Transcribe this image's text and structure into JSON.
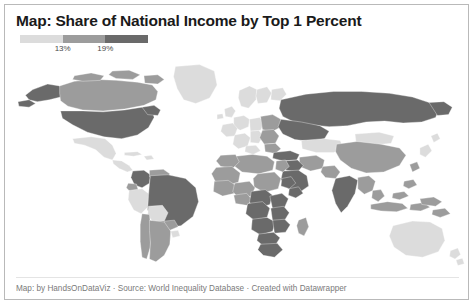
{
  "chart_data": {
    "type": "map",
    "title": "Map: Share of National Income by Top 1 Percent",
    "subtitle": "",
    "map_projection": "world-equirectangular",
    "legend": {
      "position": "top-left",
      "orientation": "horizontal",
      "breaks": [
        "13%",
        "19%"
      ],
      "tick_values": [
        13,
        19
      ],
      "unit": "%",
      "classes": [
        {
          "label": "below 13%",
          "color": "#dcdcdc"
        },
        {
          "label": "13% to 19%",
          "color": "#9c9c9c"
        },
        {
          "label": "above 19%",
          "color": "#6a6a6a"
        }
      ]
    },
    "no_data_color": "#f2f2f2",
    "regions": [
      {
        "name": "Canada",
        "class": 1,
        "value": 14.5
      },
      {
        "name": "United States",
        "class": 2,
        "value": 20.5
      },
      {
        "name": "Alaska",
        "class": 2,
        "value": 20.5
      },
      {
        "name": "Greenland",
        "class": 0,
        "value": 10.0
      },
      {
        "name": "Mexico",
        "class": 0,
        "value": 12.0
      },
      {
        "name": "Central America",
        "class": 0,
        "value": 11.5
      },
      {
        "name": "Cuba",
        "class": 0,
        "value": 10.0
      },
      {
        "name": "Brazil",
        "class": 2,
        "value": 22.0
      },
      {
        "name": "Colombia",
        "class": 2,
        "value": 20.0
      },
      {
        "name": "Venezuela",
        "class": 1,
        "value": 15.0
      },
      {
        "name": "Peru",
        "class": 0,
        "value": 12.0
      },
      {
        "name": "Bolivia",
        "class": 0,
        "value": 12.5
      },
      {
        "name": "Chile",
        "class": 1,
        "value": 17.0
      },
      {
        "name": "Argentina",
        "class": 1,
        "value": 16.5
      },
      {
        "name": "Paraguay",
        "class": 1,
        "value": 15.0
      },
      {
        "name": "Uruguay",
        "class": 0,
        "value": 12.0
      },
      {
        "name": "Ecuador",
        "class": 1,
        "value": 15.0
      },
      {
        "name": "Western Europe",
        "class": 0,
        "value": 11.0
      },
      {
        "name": "United Kingdom",
        "class": 0,
        "value": 12.0
      },
      {
        "name": "Scandinavia",
        "class": 0,
        "value": 10.0
      },
      {
        "name": "Eastern Europe",
        "class": 1,
        "value": 14.0
      },
      {
        "name": "Russia",
        "class": 2,
        "value": 23.0
      },
      {
        "name": "Turkey",
        "class": 2,
        "value": 21.0
      },
      {
        "name": "Middle East",
        "class": 2,
        "value": 25.0
      },
      {
        "name": "Saudi Arabia",
        "class": 2,
        "value": 26.0
      },
      {
        "name": "Iran",
        "class": 1,
        "value": 16.0
      },
      {
        "name": "Kazakhstan",
        "class": 0,
        "value": 12.0
      },
      {
        "name": "China",
        "class": 1,
        "value": 14.0
      },
      {
        "name": "Mongolia",
        "class": 0,
        "value": 11.0
      },
      {
        "name": "India",
        "class": 2,
        "value": 21.5
      },
      {
        "name": "Pakistan",
        "class": 1,
        "value": 15.0
      },
      {
        "name": "Southeast Asia",
        "class": 1,
        "value": 17.0
      },
      {
        "name": "Indonesia",
        "class": 1,
        "value": 16.0
      },
      {
        "name": "Japan",
        "class": 0,
        "value": 11.0
      },
      {
        "name": "Australia",
        "class": 0,
        "value": 10.5
      },
      {
        "name": "New Zealand",
        "class": 0,
        "value": 10.0
      },
      {
        "name": "North Africa",
        "class": 1,
        "value": 15.0
      },
      {
        "name": "West Africa",
        "class": 1,
        "value": 17.0
      },
      {
        "name": "Central Africa",
        "class": 2,
        "value": 22.0
      },
      {
        "name": "Southern Africa",
        "class": 2,
        "value": 24.0
      },
      {
        "name": "South Africa",
        "class": 2,
        "value": 25.0
      },
      {
        "name": "Madagascar",
        "class": 1,
        "value": 17.0
      }
    ]
  },
  "footer": {
    "credit": "Map: by HandsOnDataViz · Source: World Inequality Database · Created with Datawrapper"
  }
}
